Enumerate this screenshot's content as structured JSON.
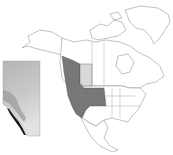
{
  "map": {
    "type": "species-range-map",
    "region": "North America",
    "colors": {
      "background": "#ffffff",
      "land": "#ffffff",
      "borders": "#777777",
      "range_primary": "#777777",
      "range_secondary": "#d9d9d9",
      "inset_light": "#d8d8d8",
      "inset_mid": "#b5b5b5",
      "inset_dark": "#1a1a1a"
    },
    "range_regions": [
      {
        "name": "British Columbia",
        "shade": "range_primary"
      },
      {
        "name": "Alberta",
        "shade": "range_secondary"
      },
      {
        "name": "Washington",
        "shade": "range_primary"
      },
      {
        "name": "Oregon",
        "shade": "range_primary"
      },
      {
        "name": "California",
        "shade": "range_primary"
      },
      {
        "name": "Idaho",
        "shade": "range_primary"
      },
      {
        "name": "Nevada",
        "shade": "range_primary"
      },
      {
        "name": "Montana",
        "shade": "range_primary"
      },
      {
        "name": "Wyoming",
        "shade": "range_primary"
      },
      {
        "name": "Utah",
        "shade": "range_primary"
      },
      {
        "name": "North Dakota",
        "shade": "range_primary"
      },
      {
        "name": "South Dakota",
        "shade": "range_primary"
      }
    ],
    "inset": {
      "region": "Alberta",
      "description": "grayscale gradient inset with darkest cells along southwestern mountain border"
    }
  }
}
